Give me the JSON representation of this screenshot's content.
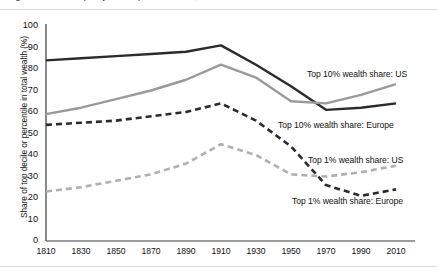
{
  "figure": {
    "clipped_title": "Figure: Wealth inequality in Europe and the US, 1810–2010",
    "background": "#ffffff"
  },
  "chart_data": {
    "type": "line",
    "title": "",
    "xlabel": "",
    "ylabel": "Share of top decile or percentile in total wealth (%)",
    "xlim": [
      1810,
      2010
    ],
    "ylim": [
      0,
      100
    ],
    "grid": false,
    "legend_position": "inline-annotations",
    "x": [
      1810,
      1830,
      1850,
      1870,
      1890,
      1910,
      1930,
      1950,
      1970,
      1990,
      2010
    ],
    "xticks": [
      "1810",
      "1830",
      "1850",
      "1870",
      "1890",
      "1910",
      "1930",
      "1950",
      "1970",
      "1990",
      "2010"
    ],
    "yticks": [
      "0",
      "10",
      "20",
      "30",
      "40",
      "50",
      "60",
      "70",
      "80",
      "90",
      "100"
    ],
    "series": [
      {
        "name": "Top 10% wealth share: Europe",
        "color": "#2b2b2b",
        "style": "solid",
        "width": 2.4,
        "values": [
          84,
          85,
          86,
          87,
          88,
          91,
          82,
          72,
          61,
          62,
          64
        ]
      },
      {
        "name": "Top 10% wealth share: US",
        "color": "#9a9a9a",
        "style": "solid",
        "width": 2.4,
        "values": [
          59,
          62,
          66,
          70,
          75,
          82,
          76,
          65,
          64,
          68,
          73
        ]
      },
      {
        "name": "Top 1% wealth share: Europe",
        "color": "#2b2b2b",
        "style": "dashed",
        "width": 2.6,
        "values": [
          54,
          55,
          56,
          58,
          60,
          64,
          56,
          44,
          26,
          21,
          24
        ]
      },
      {
        "name": "Top 1% wealth share: US",
        "color": "#b0b0b0",
        "style": "dashed",
        "width": 2.6,
        "values": [
          23,
          25,
          28,
          31,
          36,
          45,
          40,
          31,
          30,
          32,
          35
        ]
      }
    ],
    "annotations": [
      {
        "text": "Top 10% wealth share: US",
        "series": "Top 10% wealth share: US",
        "x": 307,
        "y": 69
      },
      {
        "text": "Top 10% wealth share: Europe",
        "series": "Top 10% wealth share: Europe",
        "x": 278,
        "y": 120
      },
      {
        "text": "Top 1% wealth share: US",
        "series": "Top 1% wealth share: US",
        "x": 308,
        "y": 155
      },
      {
        "text": "Top 1% wealth share: Europe",
        "series": "Top 1% wealth share: Europe",
        "x": 292,
        "y": 196
      }
    ]
  }
}
